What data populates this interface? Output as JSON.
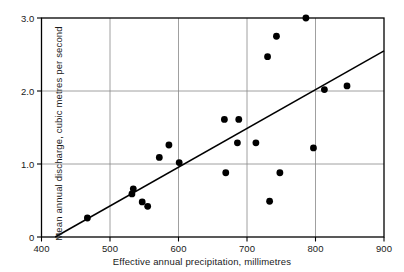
{
  "chart_data": {
    "type": "scatter",
    "title": "",
    "xlabel": "Effective annual precipitation, millimetres",
    "ylabel": "Mean annual discharge, cubic metres per second",
    "xlim": [
      400,
      900
    ],
    "ylim": [
      0,
      3.0
    ],
    "xticks": [
      "400",
      "500",
      "600",
      "700",
      "800",
      "900"
    ],
    "xtick_values": [
      400,
      500,
      600,
      700,
      800,
      900
    ],
    "yticks": [
      "0",
      "1.0",
      "2.0",
      "3.0"
    ],
    "ytick_values": [
      0,
      1.0,
      2.0,
      3.0
    ],
    "grid": true,
    "grid_color": "#888888",
    "legend": "none",
    "marker_color": "#000000",
    "marker_size": 3.4,
    "line_color": "#000000",
    "points": [
      {
        "x": 467,
        "y": 0.26
      },
      {
        "x": 534,
        "y": 0.66
      },
      {
        "x": 532,
        "y": 0.59
      },
      {
        "x": 547,
        "y": 0.48
      },
      {
        "x": 555,
        "y": 0.42
      },
      {
        "x": 572,
        "y": 1.09
      },
      {
        "x": 586,
        "y": 1.26
      },
      {
        "x": 601,
        "y": 1.02
      },
      {
        "x": 667,
        "y": 1.61
      },
      {
        "x": 688,
        "y": 1.61
      },
      {
        "x": 669,
        "y": 0.88
      },
      {
        "x": 686,
        "y": 1.29
      },
      {
        "x": 713,
        "y": 1.29
      },
      {
        "x": 730,
        "y": 2.47
      },
      {
        "x": 743,
        "y": 2.75
      },
      {
        "x": 786,
        "y": 3.0
      },
      {
        "x": 748,
        "y": 0.88
      },
      {
        "x": 733,
        "y": 0.49
      },
      {
        "x": 797,
        "y": 1.22
      },
      {
        "x": 813,
        "y": 2.02
      },
      {
        "x": 846,
        "y": 2.07
      }
    ],
    "trend_line": {
      "x0": 420,
      "y0": 0.0,
      "x1": 900,
      "y1": 2.55
    }
  },
  "axes": {
    "frame_color": "#000000"
  }
}
